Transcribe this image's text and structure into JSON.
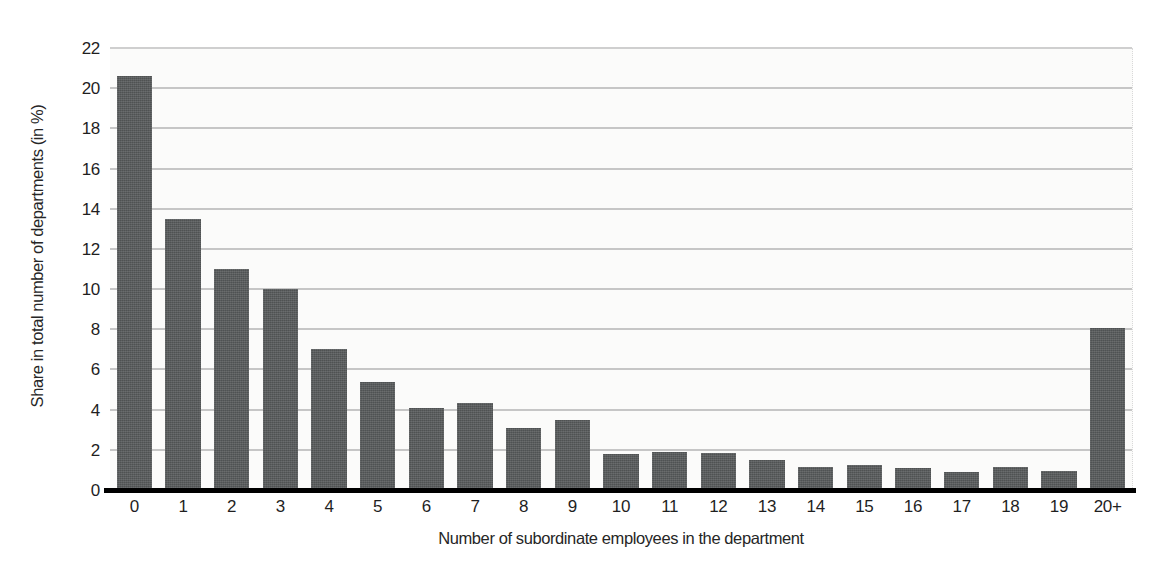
{
  "chart_data": {
    "type": "bar",
    "title": "",
    "xlabel": "Number of subordinate employees in the department",
    "ylabel": "Share in total number of departments (in %)",
    "categories": [
      "0",
      "1",
      "2",
      "3",
      "4",
      "5",
      "6",
      "7",
      "8",
      "9",
      "10",
      "11",
      "12",
      "13",
      "14",
      "15",
      "16",
      "17",
      "18",
      "19",
      "20+"
    ],
    "values": [
      20.6,
      13.5,
      11.0,
      10.0,
      7.0,
      5.4,
      4.1,
      4.35,
      3.1,
      3.5,
      1.8,
      1.9,
      1.85,
      1.5,
      1.15,
      1.25,
      1.1,
      0.9,
      1.15,
      0.95,
      8.05
    ],
    "ylim": [
      0,
      22
    ],
    "ytick_step": 2,
    "yticks": [
      "0",
      "2",
      "4",
      "6",
      "8",
      "10",
      "12",
      "14",
      "16",
      "18",
      "20",
      "22"
    ],
    "grid": true,
    "legend": false,
    "legend_position": "none",
    "series": [
      {
        "name": "Share in total number of departments (in %)",
        "values": [
          20.6,
          13.5,
          11.0,
          10.0,
          7.0,
          5.4,
          4.1,
          4.35,
          3.1,
          3.5,
          1.8,
          1.9,
          1.85,
          1.5,
          1.15,
          1.25,
          1.1,
          0.9,
          1.15,
          0.95,
          8.05
        ]
      }
    ]
  },
  "style": {
    "bar_color": "#56595a",
    "gridline_color": "#c6c6c6",
    "axis_line_color": "#000000",
    "plot_background": "#fbfbfa",
    "page_background": "#ffffff",
    "text_color": "#1f1f1f"
  }
}
